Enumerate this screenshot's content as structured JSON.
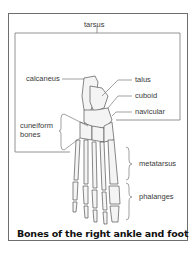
{
  "figure": {
    "title": "Bones of the right ankle and foot",
    "group_labels": {
      "tarsus": "tarsus",
      "metatarsus": "metatarsus",
      "phalanges": "phalanges"
    },
    "bone_labels": {
      "calcaneus": "calcaneus",
      "talus": "talus",
      "cuboid": "cuboid",
      "navicular": "navicular",
      "cuneiform_line1": "cuneiform",
      "cuneiform_line2": "bones"
    },
    "colors": {
      "line": "#6e6e6e",
      "text": "#3a3a3a",
      "title": "#111111",
      "bone_outline": "#555555"
    }
  }
}
